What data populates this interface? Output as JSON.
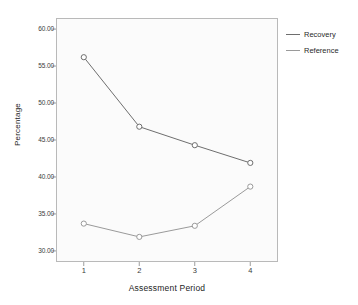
{
  "chart_data": {
    "type": "line",
    "title": "",
    "xlabel": "Assessment Period",
    "ylabel": "Percentage",
    "categories": [
      "1",
      "2",
      "3",
      "4"
    ],
    "x": [
      1,
      2,
      3,
      4
    ],
    "xlim": [
      0.5,
      4.5
    ],
    "ylim": [
      28.5,
      61.5
    ],
    "yticks": [
      "60.00",
      "55.00",
      "50.00",
      "45.00",
      "40.00",
      "35.00",
      "30.00"
    ],
    "ytick_values": [
      60,
      55,
      50,
      45,
      40,
      35,
      30
    ],
    "xticks": [
      "1",
      "2",
      "3",
      "4"
    ],
    "grid": false,
    "legend_position": "right",
    "markers": "open-circle",
    "series": [
      {
        "name": "Recovery",
        "color": "#6e6e6e",
        "values": [
          56.2,
          46.8,
          44.3,
          41.9
        ]
      },
      {
        "name": "Reference",
        "color": "#9a9a9a",
        "values": [
          33.7,
          31.9,
          33.4,
          38.7
        ]
      }
    ]
  },
  "legend": {
    "items": [
      {
        "label": "Recovery",
        "color": "#6e6e6e"
      },
      {
        "label": "Reference",
        "color": "#9a9a9a"
      }
    ]
  },
  "axes": {
    "y_title": "Percentage",
    "x_title": "Assessment Period"
  },
  "colors": {
    "plot_background": "#fbfbfb",
    "frame": "#b9b9b9",
    "text": "#2a2a2a",
    "recovery": "#6e6e6e",
    "reference": "#9a9a9a"
  }
}
